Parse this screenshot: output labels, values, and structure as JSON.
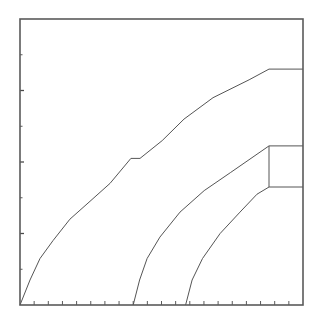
{
  "chart_data": {
    "type": "line",
    "title": "",
    "xlabel": "",
    "ylabel": "",
    "grid": false,
    "legend": null,
    "xlim": [
      0,
      20
    ],
    "ylim": [
      0,
      8
    ],
    "x_ticks": {
      "count": 20,
      "labels": []
    },
    "y_ticks": {
      "count": 8,
      "major": [
        2,
        4,
        6
      ],
      "labels": []
    },
    "series": [
      {
        "name": "curve-1",
        "points": [
          [
            0,
            0
          ],
          [
            0.71,
            0.7
          ],
          [
            1.41,
            1.3
          ],
          [
            2.33,
            1.8
          ],
          [
            3.53,
            2.4
          ],
          [
            4.95,
            2.9
          ],
          [
            6.36,
            3.4
          ],
          [
            7.84,
            4.1
          ],
          [
            8.48,
            4.1
          ],
          [
            10.05,
            4.6
          ],
          [
            11.59,
            5.2
          ],
          [
            13.64,
            5.8
          ],
          [
            16.19,
            6.3
          ],
          [
            17.6,
            6.6
          ],
          [
            20,
            6.6
          ]
        ]
      },
      {
        "name": "curve-2",
        "points": [
          [
            8.0,
            0
          ],
          [
            8.45,
            0.7
          ],
          [
            8.98,
            1.3
          ],
          [
            9.89,
            1.9
          ],
          [
            11.31,
            2.6
          ],
          [
            13.02,
            3.2
          ],
          [
            14.86,
            3.7
          ],
          [
            17.6,
            4.45
          ],
          [
            20,
            4.45
          ]
        ]
      },
      {
        "name": "curve-3",
        "points": [
          [
            11.7,
            0
          ],
          [
            12.16,
            0.7
          ],
          [
            12.9,
            1.3
          ],
          [
            14.14,
            2.0
          ],
          [
            15.55,
            2.6
          ],
          [
            16.75,
            3.1
          ],
          [
            17.6,
            3.3
          ],
          [
            20,
            3.3
          ]
        ]
      },
      {
        "name": "box-connector",
        "points": [
          [
            17.6,
            4.45
          ],
          [
            17.6,
            3.3
          ]
        ]
      }
    ]
  },
  "plot": {
    "px_left": 20,
    "px_right": 303,
    "px_top": 19,
    "px_bottom": 305
  }
}
